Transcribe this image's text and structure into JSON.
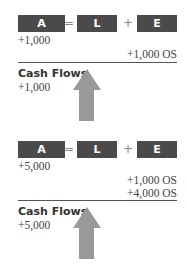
{
  "colors": {
    "box": "#4a4a4a",
    "arrow": "#999999",
    "rule": "#555555"
  },
  "panels": [
    {
      "equation": {
        "a": "A",
        "equals": "=",
        "l": "L",
        "plus": "+",
        "e": "E"
      },
      "asset_entries": [
        "+1,000"
      ],
      "equity_entries": [
        "+1,000 OS"
      ],
      "cash_flows": {
        "title": "Cash Flows",
        "entries": [
          "+1,000"
        ]
      },
      "arrow_icon": "up-arrow-icon"
    },
    {
      "equation": {
        "a": "A",
        "equals": "=",
        "l": "L",
        "plus": "+",
        "e": "E"
      },
      "asset_entries": [
        "+5,000"
      ],
      "equity_entries": [
        "+1,000 OS",
        "+4,000 OS"
      ],
      "cash_flows": {
        "title": "Cash Flows",
        "entries": [
          "+5,000"
        ]
      },
      "arrow_icon": "up-arrow-icon"
    }
  ]
}
